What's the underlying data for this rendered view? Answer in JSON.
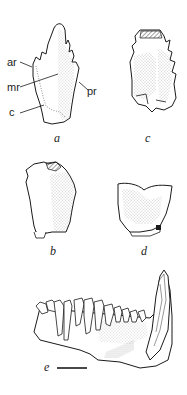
{
  "figure": {
    "panels": [
      {
        "id": "a",
        "label": "a",
        "subject": "tooth-crown-view-a"
      },
      {
        "id": "b",
        "label": "b",
        "subject": "tooth-crown-view-b"
      },
      {
        "id": "c",
        "label": "c",
        "subject": "tooth-crown-view-c"
      },
      {
        "id": "d",
        "label": "d",
        "subject": "tooth-crown-view-d"
      },
      {
        "id": "e",
        "label": "e",
        "subject": "lower-jaw-lateral-view"
      }
    ],
    "annotations": {
      "ar": "ar",
      "mr": "mr",
      "pr": "pr",
      "c": "c"
    },
    "scale_bar": {
      "visible": true
    }
  },
  "colors": {
    "ink": "#1a1a1a",
    "stipple": "#8a8a8a",
    "background": "#ffffff"
  }
}
